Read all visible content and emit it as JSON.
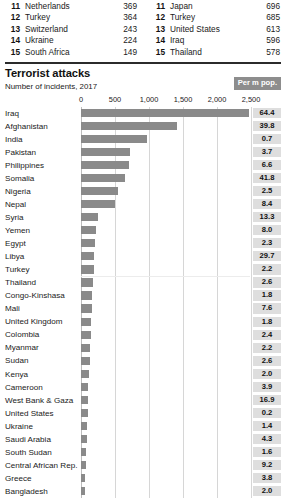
{
  "top_lists": {
    "left": {
      "rows": [
        {
          "rank": "11",
          "name": "Netherlands",
          "value": "369"
        },
        {
          "rank": "12",
          "name": "Turkey",
          "value": "364"
        },
        {
          "rank": "13",
          "name": "Switzerland",
          "value": "243"
        },
        {
          "rank": "14",
          "name": "Ukraine",
          "value": "224"
        },
        {
          "rank": "15",
          "name": "South Africa",
          "value": "149"
        }
      ]
    },
    "right": {
      "rows": [
        {
          "rank": "11",
          "name": "Japan",
          "value": "696"
        },
        {
          "rank": "12",
          "name": "Turkey",
          "value": "685"
        },
        {
          "rank": "13",
          "name": "United States",
          "value": "613"
        },
        {
          "rank": "14",
          "name": "Iraq",
          "value": "596"
        },
        {
          "rank": "15",
          "name": "Thailand",
          "value": "578"
        }
      ]
    }
  },
  "chart": {
    "title": "Terrorist attacks",
    "subtitle": "Number of incidents, 2017",
    "per_m_pop_label": "Per m pop.",
    "accent_bar_color": "#8a8a8a",
    "badge_color": "#8d8d8d",
    "value_box_color": "#dedede"
  },
  "chart_data": {
    "type": "bar",
    "orientation": "horizontal",
    "title": "Terrorist attacks",
    "subtitle": "Number of incidents, 2017",
    "xlabel": "",
    "ylabel": "",
    "xlim": [
      0,
      2500
    ],
    "xticks": [
      0,
      500,
      1000,
      1500,
      2000,
      2500
    ],
    "xtick_labels": [
      "0",
      "500",
      "1,000",
      "1,500",
      "2,000",
      "2,500"
    ],
    "grid": true,
    "legend": false,
    "secondary_column": {
      "name": "Per m pop.",
      "label": "Per m pop."
    },
    "categories": [
      "Iraq",
      "Afghanistan",
      "India",
      "Pakistan",
      "Philippines",
      "Somalia",
      "Nigeria",
      "Nepal",
      "Syria",
      "Yemen",
      "Egypt",
      "Libya",
      "Turkey",
      "Thailand",
      "Congo-Kinshasa",
      "Mali",
      "United Kingdom",
      "Colombia",
      "Myanmar",
      "Sudan",
      "Kenya",
      "Cameroon",
      "West Bank & Gaza",
      "United States",
      "Ukraine",
      "Saudi Arabia",
      "South Sudan",
      "Central African Rep.",
      "Greece",
      "Bangladesh"
    ],
    "values": [
      2466,
      1414,
      966,
      719,
      711,
      641,
      540,
      500,
      250,
      216,
      208,
      198,
      190,
      182,
      162,
      155,
      148,
      140,
      133,
      126,
      118,
      110,
      103,
      96,
      90,
      84,
      78,
      72,
      66,
      60
    ],
    "per_m_pop": [
      64.4,
      39.8,
      0.7,
      3.7,
      6.6,
      41.8,
      2.5,
      8.4,
      13.3,
      8.0,
      2.3,
      29.7,
      2.2,
      2.6,
      1.8,
      7.6,
      1.8,
      2.4,
      2.2,
      2.6,
      2.0,
      3.9,
      16.9,
      0.2,
      1.4,
      4.3,
      1.6,
      9.2,
      3.8,
      2.0
    ],
    "rows": [
      {
        "country": "Iraq",
        "incidents": 2466,
        "per_m_pop": "64.4"
      },
      {
        "country": "Afghanistan",
        "incidents": 1414,
        "per_m_pop": "39.8"
      },
      {
        "country": "India",
        "incidents": 966,
        "per_m_pop": "0.7"
      },
      {
        "country": "Pakistan",
        "incidents": 719,
        "per_m_pop": "3.7"
      },
      {
        "country": "Philippines",
        "incidents": 711,
        "per_m_pop": "6.6"
      },
      {
        "country": "Somalia",
        "incidents": 641,
        "per_m_pop": "41.8"
      },
      {
        "country": "Nigeria",
        "incidents": 540,
        "per_m_pop": "2.5"
      },
      {
        "country": "Nepal",
        "incidents": 500,
        "per_m_pop": "8.4"
      },
      {
        "country": "Syria",
        "incidents": 250,
        "per_m_pop": "13.3"
      },
      {
        "country": "Yemen",
        "incidents": 216,
        "per_m_pop": "8.0"
      },
      {
        "country": "Egypt",
        "incidents": 208,
        "per_m_pop": "2.3"
      },
      {
        "country": "Libya",
        "incidents": 198,
        "per_m_pop": "29.7"
      },
      {
        "country": "Turkey",
        "incidents": 190,
        "per_m_pop": "2.2"
      },
      {
        "country": "Thailand",
        "incidents": 182,
        "per_m_pop": "2.6"
      },
      {
        "country": "Congo-Kinshasa",
        "incidents": 162,
        "per_m_pop": "1.8"
      },
      {
        "country": "Mali",
        "incidents": 155,
        "per_m_pop": "7.6"
      },
      {
        "country": "United Kingdom",
        "incidents": 148,
        "per_m_pop": "1.8"
      },
      {
        "country": "Colombia",
        "incidents": 140,
        "per_m_pop": "2.4"
      },
      {
        "country": "Myanmar",
        "incidents": 133,
        "per_m_pop": "2.2"
      },
      {
        "country": "Sudan",
        "incidents": 126,
        "per_m_pop": "2.6"
      },
      {
        "country": "Kenya",
        "incidents": 118,
        "per_m_pop": "2.0"
      },
      {
        "country": "Cameroon",
        "incidents": 110,
        "per_m_pop": "3.9"
      },
      {
        "country": "West Bank & Gaza",
        "incidents": 103,
        "per_m_pop": "16.9"
      },
      {
        "country": "United States",
        "incidents": 96,
        "per_m_pop": "0.2"
      },
      {
        "country": "Ukraine",
        "incidents": 90,
        "per_m_pop": "1.4"
      },
      {
        "country": "Saudi Arabia",
        "incidents": 84,
        "per_m_pop": "4.3"
      },
      {
        "country": "South Sudan",
        "incidents": 78,
        "per_m_pop": "1.6"
      },
      {
        "country": "Central African Rep.",
        "incidents": 72,
        "per_m_pop": "9.2"
      },
      {
        "country": "Greece",
        "incidents": 66,
        "per_m_pop": "3.8"
      },
      {
        "country": "Bangladesh",
        "incidents": 60,
        "per_m_pop": "2.0"
      }
    ]
  }
}
